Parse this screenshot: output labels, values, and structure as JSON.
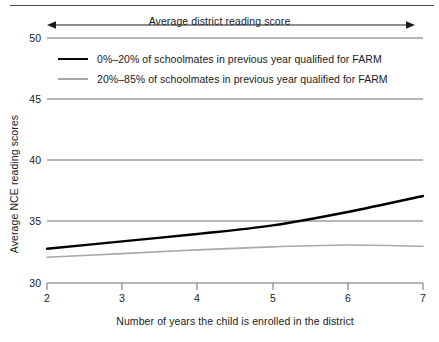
{
  "chart_data": {
    "type": "line",
    "title": "",
    "xlabel": "Number of years the child is enrolled in the district",
    "ylabel": "Average NCE reading scores",
    "xlim": [
      2,
      7
    ],
    "ylim": [
      30,
      50
    ],
    "xticks": [
      2,
      3,
      4,
      5,
      6,
      7
    ],
    "xtick_labels": [
      "2",
      "3",
      "4",
      "5",
      "6",
      "7"
    ],
    "yticks": [
      30,
      35,
      40,
      45,
      50
    ],
    "ytick_labels": [
      "30",
      "35",
      "40",
      "45",
      "50"
    ],
    "grid": "horizontal",
    "legend_position": "upper-left-inside",
    "x": [
      2,
      3,
      4,
      5,
      6,
      7
    ],
    "series": [
      {
        "name": "0%–20% of schoolmates in previous year qualified for FARM",
        "color": "#000000",
        "width": 2.4,
        "values": [
          32.8,
          33.4,
          34.0,
          34.7,
          35.8,
          37.1
        ]
      },
      {
        "name": "20%–85% of schoolmates in previous year qualified for FARM",
        "color": "#a8a8a8",
        "width": 1.6,
        "values": [
          32.1,
          32.4,
          32.7,
          32.95,
          33.1,
          33.0
        ]
      }
    ],
    "annotations": [
      {
        "name": "average-district-reading-score-arrow",
        "text": "Average district reading score",
        "style": "double-headed-arrow",
        "x_start": 2,
        "x_end": 6.9
      }
    ]
  },
  "legend": {
    "items": [
      {
        "label": "0%–20% of schoolmates in previous year qualified for FARM"
      },
      {
        "label": "20%–85% of schoolmates in previous year qualified for FARM"
      }
    ]
  },
  "axes": {
    "y_title": "Average NCE reading scores",
    "x_title": "Number of years the child is enrolled in the district"
  },
  "colors": {
    "series_black": "#000000",
    "series_gray": "#a8a8a8",
    "gridline": "#6e6e6e",
    "axis": "#6e6e6e",
    "text": "#1a1a1a"
  }
}
